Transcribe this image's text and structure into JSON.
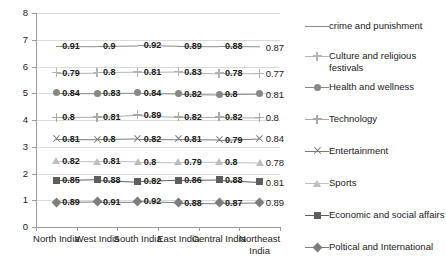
{
  "chart_data": {
    "type": "line",
    "title": "",
    "xlabel": "",
    "ylabel": "",
    "ylim": [
      0,
      8
    ],
    "ytick_step": 1,
    "yticks": [
      "0",
      "1",
      "2",
      "3",
      "4",
      "5",
      "6",
      "7",
      "8"
    ],
    "grid": true,
    "legend_position": "right",
    "categories": [
      "North India",
      "West India",
      "South India",
      "East India",
      "Central India",
      "Northeast India"
    ],
    "series": [
      {
        "name": "crime and punishment",
        "values": [
          0.91,
          0.9,
          0.92,
          0.89,
          0.88,
          0.87
        ],
        "labels": [
          "0.91",
          "0.9",
          "0.92",
          "0.89",
          "0.88",
          "0.87"
        ],
        "marker": "none",
        "color": "#8c8c8c",
        "baseline": 6.72
      },
      {
        "name": "Culture and religious festivals",
        "values": [
          0.79,
          0.8,
          0.81,
          0.83,
          0.78,
          0.77
        ],
        "labels": [
          "0.79",
          "0.8",
          "0.81",
          "0.83",
          "0.78",
          "0.77"
        ],
        "marker": "plus",
        "color": "#b3b3b3",
        "baseline": 5.83
      },
      {
        "name": "Health and wellness",
        "values": [
          0.84,
          0.83,
          0.84,
          0.82,
          0.8,
          0.81
        ],
        "labels": [
          "0.84",
          "0.83",
          "0.84",
          "0.82",
          "0.8",
          "0.81"
        ],
        "marker": "circle",
        "color": "#878787",
        "baseline": 5.02
      },
      {
        "name": "Technology",
        "values": [
          0.8,
          0.81,
          0.89,
          0.82,
          0.82,
          0.8
        ],
        "labels": [
          "0.8",
          "0.81",
          "0.89",
          "0.82",
          "0.82",
          "0.8"
        ],
        "marker": "plus",
        "color": "#a8a8a8",
        "baseline": 4.15
      },
      {
        "name": "Entertainment",
        "values": [
          0.81,
          0.8,
          0.82,
          0.81,
          0.79,
          0.84
        ],
        "labels": [
          "0.81",
          "0.8",
          "0.82",
          "0.81",
          "0.79",
          "0.84"
        ],
        "marker": "x",
        "color": "#7a7a7a",
        "baseline": 3.33
      },
      {
        "name": "Sports",
        "values": [
          0.82,
          0.81,
          0.8,
          0.79,
          0.8,
          0.78
        ],
        "labels": [
          "0.82",
          "0.81",
          "0.8",
          "0.79",
          "0.8",
          "0.78"
        ],
        "marker": "triangle",
        "color": "#bdbdbd",
        "baseline": 2.5
      },
      {
        "name": "Economic and social affairs",
        "values": [
          0.85,
          0.88,
          0.82,
          0.86,
          0.88,
          0.81
        ],
        "labels": [
          "0.85",
          "0.88",
          "0.82",
          "0.86",
          "0.88",
          "0.81"
        ],
        "marker": "square",
        "color": "#5e5e5e",
        "baseline": 1.74
      },
      {
        "name": "Poltical and International",
        "values": [
          0.89,
          0.91,
          0.92,
          0.88,
          0.87,
          0.89
        ],
        "labels": [
          "0.89",
          "0.91",
          "0.92",
          "0.88",
          "0.87",
          "0.89"
        ],
        "marker": "diamond",
        "color": "#7d7d7d",
        "baseline": 0.88
      }
    ]
  },
  "legend": {
    "items": [
      {
        "label": "crime and punishment",
        "marker": "none",
        "color": "#8c8c8c",
        "top": 14
      },
      {
        "label": "Culture and religious festivals",
        "marker": "plus",
        "color": "#b3b3b3",
        "top": 44
      },
      {
        "label": "Health and wellness",
        "marker": "circle",
        "color": "#878787",
        "top": 75
      },
      {
        "label": "Technology",
        "marker": "plus",
        "color": "#a8a8a8",
        "top": 107
      },
      {
        "label": "Entertainment",
        "marker": "x",
        "color": "#7a7a7a",
        "top": 139
      },
      {
        "label": "Sports",
        "marker": "triangle",
        "color": "#bdbdbd",
        "top": 171
      },
      {
        "label": "Economic and social affairs",
        "marker": "square",
        "color": "#5e5e5e",
        "top": 203
      },
      {
        "label": "Poltical and International",
        "marker": "diamond",
        "color": "#7d7d7d",
        "top": 235
      }
    ]
  }
}
